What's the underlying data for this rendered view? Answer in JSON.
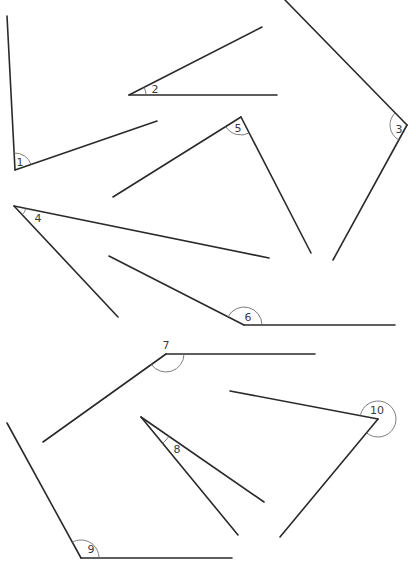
{
  "diagram": {
    "title": "",
    "angles": [
      {
        "label": "1",
        "vertex": [
          15,
          170
        ],
        "arm1": [
          7,
          16
        ],
        "arm2": [
          157,
          121
        ],
        "arc_r": 17,
        "label_pos": [
          20,
          166
        ],
        "reflex": false
      },
      {
        "label": "2",
        "vertex": [
          129,
          95
        ],
        "arm1": [
          262,
          27
        ],
        "arm2": [
          277,
          95
        ],
        "arc_r": 17,
        "label_pos": [
          155,
          93
        ],
        "reflex": false
      },
      {
        "label": "3",
        "vertex": [
          407,
          125
        ],
        "arm1": [
          285,
          0
        ],
        "arm2": [
          333,
          260
        ],
        "arc_r": 17,
        "label_pos": [
          399,
          133
        ],
        "reflex": false
      },
      {
        "label": "4",
        "vertex": [
          14,
          206
        ],
        "arm1": [
          269,
          258
        ],
        "arm2": [
          118,
          317
        ],
        "arc_r": 12,
        "label_pos": [
          38,
          222
        ],
        "reflex": false
      },
      {
        "label": "5",
        "vertex": [
          241,
          117
        ],
        "arm1": [
          113,
          197
        ],
        "arm2": [
          311,
          253
        ],
        "arc_r": 18,
        "label_pos": [
          238,
          132
        ],
        "reflex": false
      },
      {
        "label": "6",
        "vertex": [
          244,
          325
        ],
        "arm1": [
          109,
          256
        ],
        "arm2": [
          395,
          325
        ],
        "arc_r": 18,
        "label_pos": [
          248,
          321
        ],
        "reflex": false
      },
      {
        "label": "7",
        "vertex": [
          166,
          354
        ],
        "arm1": [
          43,
          442
        ],
        "arm2": [
          315,
          354
        ],
        "arc_r": 18,
        "label_pos": [
          166,
          349
        ],
        "reflex": false
      },
      {
        "label": "8",
        "vertex": [
          141,
          417
        ],
        "arm1": [
          264,
          502
        ],
        "arm2": [
          238,
          535
        ],
        "arc_r": 34,
        "label_pos": [
          177,
          453
        ],
        "reflex": false
      },
      {
        "label": "9",
        "vertex": [
          81,
          558
        ],
        "arm1": [
          7,
          423
        ],
        "arm2": [
          232,
          558
        ],
        "arc_r": 18,
        "label_pos": [
          91,
          553
        ],
        "reflex": false
      },
      {
        "label": "10",
        "vertex": [
          378,
          419
        ],
        "arm1": [
          230,
          391
        ],
        "arm2": [
          280,
          537
        ],
        "arc_r": 18,
        "label_pos": [
          377,
          414
        ],
        "reflex": true
      }
    ],
    "colors": {
      "line": "#2a2a2a",
      "arc": "#6e6e6e",
      "label": "#3a3a3a",
      "background": "#ffffff"
    }
  }
}
